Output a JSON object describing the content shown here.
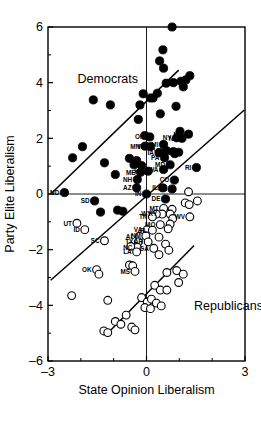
{
  "chart_data": {
    "type": "scatter",
    "title": "",
    "xlabel": "State Opinion Liberalism",
    "ylabel": "Party Elite Liberalism",
    "xlim": [
      -3,
      3
    ],
    "ylim": [
      -6,
      6
    ],
    "xticks": [
      -3,
      0,
      3
    ],
    "xtick_labels": [
      "–3",
      "0",
      "3"
    ],
    "yticks": [
      6,
      4,
      2,
      0,
      -2,
      -4,
      -6
    ],
    "ytick_labels": [
      "6",
      "4",
      "2",
      "0",
      "–2",
      "–4",
      "–6"
    ],
    "grid": false,
    "legend": "none",
    "annotations": [
      {
        "text": "Democrats",
        "x": -2.1,
        "y": 4.0
      },
      {
        "text": "Republicans",
        "x": 1.45,
        "y": -4.15
      }
    ],
    "series": [
      {
        "name": "Democrats",
        "marker": "filled-circle",
        "color": "#000000",
        "points": [
          {
            "label": "",
            "x": 0.78,
            "y": 6.0
          },
          {
            "label": "",
            "x": 0.5,
            "y": 5.18
          },
          {
            "label": "",
            "x": 0.4,
            "y": 4.78
          },
          {
            "label": "",
            "x": 0.52,
            "y": 4.52
          },
          {
            "label": "",
            "x": 1.32,
            "y": 4.25
          },
          {
            "label": "",
            "x": 1.2,
            "y": 4.1
          },
          {
            "label": "",
            "x": 1.05,
            "y": 4.05
          },
          {
            "label": "",
            "x": 0.82,
            "y": 4.0
          },
          {
            "label": "",
            "x": 0.6,
            "y": 3.98
          },
          {
            "label": "",
            "x": 1.12,
            "y": 3.85
          },
          {
            "label": "",
            "x": 0.33,
            "y": 3.62
          },
          {
            "label": "",
            "x": -0.1,
            "y": 3.6
          },
          {
            "label": "",
            "x": 0.2,
            "y": 3.45
          },
          {
            "label": "",
            "x": 0.12,
            "y": 3.45
          },
          {
            "label": "",
            "x": -1.62,
            "y": 3.38
          },
          {
            "label": "",
            "x": -1.1,
            "y": 3.2
          },
          {
            "label": "",
            "x": -0.2,
            "y": 3.2
          },
          {
            "label": "",
            "x": 0.9,
            "y": 3.15
          },
          {
            "label": "",
            "x": 0.42,
            "y": 2.88
          },
          {
            "label": "",
            "x": -0.25,
            "y": 2.68
          },
          {
            "label": "",
            "x": 1.02,
            "y": 2.25
          },
          {
            "label": "",
            "x": -0.05,
            "y": 2.1
          },
          {
            "label": "OR",
            "x": 0.1,
            "y": 2.05
          },
          {
            "label": "MN",
            "x": -0.04,
            "y": 1.72
          },
          {
            "label": "WI",
            "x": 0.12,
            "y": 1.7
          },
          {
            "label": "MI",
            "x": 0.52,
            "y": 1.78
          },
          {
            "label": "NY",
            "x": 0.92,
            "y": 2.02
          },
          {
            "label": "NJ",
            "x": 1.08,
            "y": 2.0
          },
          {
            "label": "MA",
            "x": 1.28,
            "y": 2.15
          },
          {
            "label": "VT",
            "x": 0.62,
            "y": 1.55
          },
          {
            "label": "CT",
            "x": 0.82,
            "y": 1.52
          },
          {
            "label": "CA",
            "x": 0.98,
            "y": 1.5
          },
          {
            "label": "IA",
            "x": 0.38,
            "y": 1.48
          },
          {
            "label": "PA",
            "x": 0.55,
            "y": 1.3
          },
          {
            "label": "",
            "x": -2.25,
            "y": 1.3
          },
          {
            "label": "",
            "x": -1.95,
            "y": 1.7
          },
          {
            "label": "",
            "x": -1.28,
            "y": 1.12
          },
          {
            "label": "",
            "x": -0.52,
            "y": 1.28
          },
          {
            "label": "",
            "x": -0.3,
            "y": 1.2
          },
          {
            "label": "",
            "x": -0.15,
            "y": 1.02
          },
          {
            "label": "",
            "x": -0.38,
            "y": 1.05
          },
          {
            "label": "",
            "x": 0.86,
            "y": 1.45
          },
          {
            "label": "MD",
            "x": 0.72,
            "y": 1.05
          },
          {
            "label": "RI",
            "x": 1.52,
            "y": 0.95
          },
          {
            "label": "WA",
            "x": 0.52,
            "y": 0.88
          },
          {
            "label": "KS",
            "x": 0.05,
            "y": 0.82
          },
          {
            "label": "ME",
            "x": -0.18,
            "y": 0.78
          },
          {
            "label": "",
            "x": -0.95,
            "y": 0.7
          },
          {
            "label": "NH",
            "x": -0.28,
            "y": 0.52
          },
          {
            "label": "CO",
            "x": 0.85,
            "y": 0.5
          },
          {
            "label": "AZ",
            "x": -0.3,
            "y": 0.22
          },
          {
            "label": "OH",
            "x": 0.78,
            "y": 0.18
          },
          {
            "label": "IL",
            "x": 0.5,
            "y": 0.22
          },
          {
            "label": "IN",
            "x": 0.0,
            "y": 0.0
          },
          {
            "label": "DE",
            "x": 0.58,
            "y": -0.18
          },
          {
            "label": "ND",
            "x": -2.5,
            "y": 0.05
          },
          {
            "label": "SD",
            "x": -1.58,
            "y": -0.25
          },
          {
            "label": "",
            "x": -1.4,
            "y": -0.65
          },
          {
            "label": "",
            "x": -0.88,
            "y": -0.58
          },
          {
            "label": "",
            "x": -0.72,
            "y": -0.62
          }
        ]
      },
      {
        "name": "Republicans",
        "marker": "open-circle",
        "color": "#ffffff",
        "points": [
          {
            "label": "",
            "x": 1.28,
            "y": 0.08
          },
          {
            "label": "",
            "x": 1.55,
            "y": -0.25
          },
          {
            "label": "",
            "x": 1.18,
            "y": -0.32
          },
          {
            "label": "",
            "x": 1.3,
            "y": -0.38
          },
          {
            "label": "MT",
            "x": 0.52,
            "y": -0.52
          },
          {
            "label": "KY",
            "x": 0.48,
            "y": -0.72
          },
          {
            "label": "WY",
            "x": 0.3,
            "y": -0.72
          },
          {
            "label": "TN",
            "x": 0.18,
            "y": -0.82
          },
          {
            "label": "",
            "x": 0.78,
            "y": -0.55
          },
          {
            "label": "",
            "x": 0.72,
            "y": -0.72
          },
          {
            "label": "",
            "x": 0.8,
            "y": -0.88
          },
          {
            "label": "WV",
            "x": 1.32,
            "y": -0.82
          },
          {
            "label": "MO",
            "x": 0.42,
            "y": -1.1
          },
          {
            "label": "",
            "x": 0.72,
            "y": -1.08
          },
          {
            "label": "",
            "x": 0.66,
            "y": -1.25
          },
          {
            "label": "VA",
            "x": 0.02,
            "y": -1.28
          },
          {
            "label": "FL",
            "x": 0.18,
            "y": -1.3
          },
          {
            "label": "AL",
            "x": -0.22,
            "y": -1.52
          },
          {
            "label": "NM",
            "x": -0.02,
            "y": -1.5
          },
          {
            "label": "TX",
            "x": -0.25,
            "y": -1.72
          },
          {
            "label": "AR",
            "x": 0.05,
            "y": -1.72
          },
          {
            "label": "",
            "x": 0.38,
            "y": -1.55
          },
          {
            "label": "",
            "x": 0.58,
            "y": -1.8
          },
          {
            "label": "NC",
            "x": -0.28,
            "y": -1.92
          },
          {
            "label": "GA",
            "x": 0.22,
            "y": -1.95
          },
          {
            "label": "LA",
            "x": -0.3,
            "y": -2.08
          },
          {
            "label": "",
            "x": -0.48,
            "y": -1.88
          },
          {
            "label": "",
            "x": 0.68,
            "y": -2.02
          },
          {
            "label": "SC",
            "x": -1.28,
            "y": -1.68
          },
          {
            "label": "",
            "x": 0.38,
            "y": -2.18
          },
          {
            "label": "",
            "x": -0.52,
            "y": -2.55
          },
          {
            "label": "",
            "x": -0.42,
            "y": -2.58
          },
          {
            "label": "MS",
            "x": -0.35,
            "y": -2.78
          },
          {
            "label": "OK",
            "x": -1.52,
            "y": -2.72
          },
          {
            "label": "",
            "x": -1.45,
            "y": -2.88
          },
          {
            "label": "",
            "x": 0.62,
            "y": -2.82
          },
          {
            "label": "",
            "x": 0.92,
            "y": -2.75
          },
          {
            "label": "",
            "x": 1.12,
            "y": -2.88
          },
          {
            "label": "",
            "x": 0.98,
            "y": -3.18
          },
          {
            "label": "",
            "x": 0.25,
            "y": -3.28
          },
          {
            "label": "",
            "x": 0.42,
            "y": -3.45
          },
          {
            "label": "",
            "x": 0.62,
            "y": -3.45
          },
          {
            "label": "",
            "x": -2.28,
            "y": -3.65
          },
          {
            "label": "",
            "x": -1.18,
            "y": -3.82
          },
          {
            "label": "",
            "x": -0.15,
            "y": -3.72
          },
          {
            "label": "",
            "x": 0.02,
            "y": -3.88
          },
          {
            "label": "",
            "x": 0.15,
            "y": -3.78
          },
          {
            "label": "",
            "x": 0.3,
            "y": -3.92
          },
          {
            "label": "",
            "x": 0.45,
            "y": -4.02
          },
          {
            "label": "",
            "x": -0.05,
            "y": -4.08
          },
          {
            "label": "",
            "x": 0.12,
            "y": -4.12
          },
          {
            "label": "",
            "x": -0.62,
            "y": -4.35
          },
          {
            "label": "",
            "x": -0.95,
            "y": -4.58
          },
          {
            "label": "",
            "x": -0.78,
            "y": -4.68
          },
          {
            "label": "",
            "x": -0.45,
            "y": -4.78
          },
          {
            "label": "",
            "x": -0.35,
            "y": -4.88
          },
          {
            "label": "",
            "x": -1.3,
            "y": -4.92
          },
          {
            "label": "",
            "x": -1.18,
            "y": -4.98
          },
          {
            "label": "UT",
            "x": -2.12,
            "y": -1.05
          },
          {
            "label": "ID",
            "x": -1.88,
            "y": -1.28
          }
        ]
      }
    ],
    "trendlines": [
      {
        "name": "democrat-fit",
        "x1": -2.9,
        "y1": 0.02,
        "x2": 0.98,
        "y2": 4.45
      },
      {
        "name": "middle-fit",
        "x1": -2.92,
        "y1": -3.1,
        "x2": 2.98,
        "y2": 3.02
      },
      {
        "name": "republican-fit",
        "x1": -1.22,
        "y1": -5.05,
        "x2": 1.45,
        "y2": -1.85
      }
    ]
  }
}
